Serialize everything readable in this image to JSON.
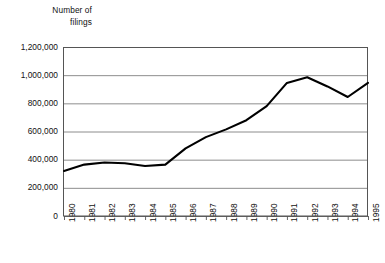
{
  "chart_data": {
    "type": "line",
    "title": "Number of\nfilings",
    "xlabel": "",
    "ylabel": "Number of filings",
    "categories": [
      "1980",
      "1981",
      "1982",
      "1983",
      "1984",
      "1985",
      "1986",
      "1987",
      "1988",
      "1989",
      "1990",
      "1991",
      "1992",
      "1993",
      "1994",
      "1995"
    ],
    "values": [
      320000,
      365000,
      380000,
      375000,
      355000,
      365000,
      480000,
      560000,
      615000,
      680000,
      780000,
      945000,
      985000,
      920000,
      845000,
      945000
    ],
    "ylim": [
      0,
      1200000
    ],
    "yticks": [
      0,
      200000,
      400000,
      600000,
      800000,
      1000000,
      1200000
    ],
    "ytick_labels": [
      "0",
      "200,000",
      "400,000",
      "600,000",
      "800,000",
      "1,000,000",
      "1,200,000"
    ],
    "grid": true,
    "legend": "none",
    "line_color": "#000000",
    "grid_color": "#808080",
    "axis_color": "#555555"
  }
}
